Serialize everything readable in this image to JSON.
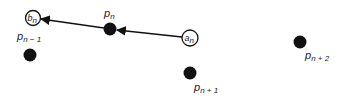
{
  "diagram": {
    "colors": {
      "stroke": "#111111",
      "dot": "#111111",
      "background": "#ffffff",
      "text": "#222222"
    },
    "nodes": {
      "b_n": {
        "base": "b",
        "sub": "n",
        "type": "hollow-circle",
        "cx": 33,
        "cy": 18,
        "r": 7.5
      },
      "a_n": {
        "base": "a",
        "sub": "n",
        "type": "hollow-circle",
        "cx": 190,
        "cy": 38,
        "r": 8
      },
      "p_n": {
        "base": "p",
        "sub": "n",
        "type": "filled-dot",
        "cx": 110,
        "cy": 29,
        "r": 6.5,
        "label_x": 104,
        "label_y": 17
      },
      "p_n_minus_1": {
        "base": "p",
        "sub": "n − 1",
        "type": "filled-dot",
        "cx": 30,
        "cy": 55,
        "r": 6.5,
        "label_x": 17,
        "label_y": 41
      },
      "p_n_plus_1": {
        "base": "p",
        "sub": "n + 1",
        "type": "filled-dot",
        "cx": 190,
        "cy": 73,
        "r": 6.5,
        "label_x": 194,
        "label_y": 92
      },
      "p_n_plus_2": {
        "base": "p",
        "sub": "n + 2",
        "type": "filled-dot",
        "cx": 300,
        "cy": 42,
        "r": 6.5,
        "label_x": 305,
        "label_y": 60
      }
    },
    "edges": [
      {
        "from": "a_n",
        "to": "p_n",
        "arrowhead": "at-target"
      },
      {
        "from": "p_n",
        "to": "b_n",
        "arrowhead": "at-target"
      }
    ]
  }
}
